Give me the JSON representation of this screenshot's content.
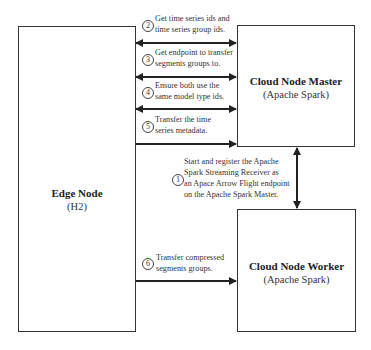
{
  "nodes": {
    "edge": {
      "title": "Edge Node",
      "subtitle": "(H2)"
    },
    "master": {
      "title": "Cloud Node Master",
      "subtitle": "(Apache Spark)"
    },
    "worker": {
      "title": "Cloud Node Worker",
      "subtitle": "(Apache Spark)"
    }
  },
  "steps": [
    {
      "number": "1",
      "lines": [
        "Start and register the Apache",
        "Spark Streaming Receiver as",
        "an Apace Arrow Flight endpoint",
        "on the Apache Spark Master."
      ],
      "from": "worker",
      "to": "master",
      "direction": "bidirectional"
    },
    {
      "number": "2",
      "lines": [
        "Get time series ids and",
        "time series group ids."
      ],
      "from": "edge",
      "to": "master",
      "direction": "bidirectional"
    },
    {
      "number": "3",
      "lines": [
        "Get endpoint to transfer",
        "segments groups to."
      ],
      "from": "edge",
      "to": "master",
      "direction": "bidirectional"
    },
    {
      "number": "4",
      "lines": [
        "Ensure both use the",
        "same model type ids."
      ],
      "from": "edge",
      "to": "master",
      "direction": "bidirectional"
    },
    {
      "number": "5",
      "lines": [
        "Transfer the time",
        "series metadata."
      ],
      "from": "edge",
      "to": "master",
      "direction": "forward"
    },
    {
      "number": "6",
      "lines": [
        "Transfer compressed",
        "segments groups."
      ],
      "from": "edge",
      "to": "worker",
      "direction": "forward"
    }
  ],
  "colors": {
    "stroke": "#222222",
    "text": "#333333",
    "background": "#ffffff"
  }
}
